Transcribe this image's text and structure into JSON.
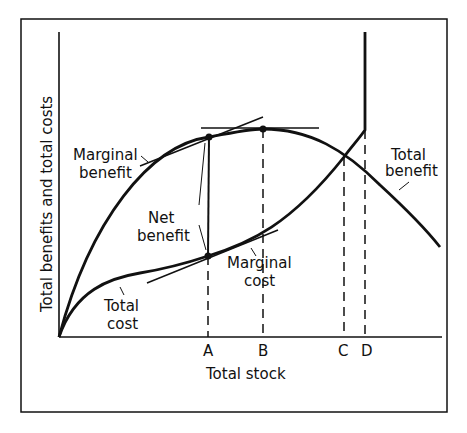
{
  "figure": {
    "y_axis_label": "Total benefits and total costs",
    "x_axis_label": "Total stock",
    "x_ticks": [
      "A",
      "B",
      "C",
      "D"
    ],
    "labels": {
      "marginal_benefit_1": "Marginal",
      "marginal_benefit_2": "benefit",
      "net_benefit_1": "Net",
      "net_benefit_2": "benefit",
      "marginal_cost_1": "Marginal",
      "marginal_cost_2": "cost",
      "total_cost_1": "Total",
      "total_cost_2": "cost",
      "total_benefit_1": "Total",
      "total_benefit_2": "benefit"
    },
    "curves": [
      {
        "name": "Total benefit",
        "shape": "concave, rising from origin to peak at B then falling"
      },
      {
        "name": "Total cost",
        "shape": "rising, flattening then steepening; becomes vertical at D"
      }
    ],
    "annotations": [
      "Tangent to total benefit at A (marginal benefit) parallel to tangent to total cost at A (marginal cost)",
      "Horizontal tangent at peak of total benefit at B",
      "Total benefit and total cost intersect at C",
      "Vertical segment between curves at A marks net benefit"
    ],
    "line_color": "#111111",
    "background": "#ffffff"
  }
}
